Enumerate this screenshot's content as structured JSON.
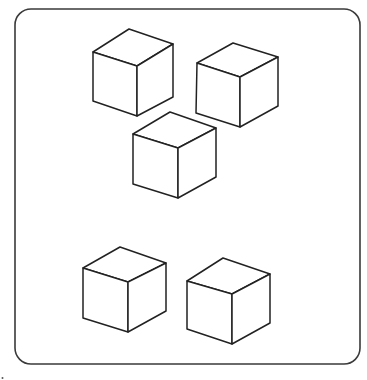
{
  "figure": {
    "frame": {
      "x": 15,
      "y": 9,
      "width": 345,
      "height": 355,
      "radius": 16,
      "stroke": "#3a3a3a"
    },
    "cube_stroke": "#222222",
    "background": "#ffffff",
    "cube_count": 5,
    "cubes": [
      {
        "name": "cube-top-left",
        "top": [
          129,
          29
        ],
        "left_top": [
          93,
          52
        ],
        "right_top": [
          173,
          44
        ],
        "front": [
          137,
          66
        ],
        "left_bottom": [
          93,
          101
        ],
        "front_bottom": [
          137,
          116
        ],
        "right_bottom": [
          173,
          97
        ]
      },
      {
        "name": "cube-top-right",
        "top": [
          233,
          43
        ],
        "left_top": [
          197,
          63
        ],
        "right_top": [
          278,
          57
        ],
        "front": [
          240,
          77
        ],
        "left_bottom": [
          196,
          113
        ],
        "front_bottom": [
          240,
          127
        ],
        "right_bottom": [
          278,
          106
        ]
      },
      {
        "name": "cube-middle",
        "top": [
          170,
          112
        ],
        "left_top": [
          133,
          134
        ],
        "right_top": [
          216,
          128
        ],
        "front": [
          178,
          148
        ],
        "left_bottom": [
          133,
          184
        ],
        "front_bottom": [
          178,
          198
        ],
        "right_bottom": [
          216,
          177
        ]
      },
      {
        "name": "cube-bottom-left",
        "top": [
          120,
          247
        ],
        "left_top": [
          83,
          268
        ],
        "right_top": [
          166,
          263
        ],
        "front": [
          128,
          282
        ],
        "left_bottom": [
          83,
          318
        ],
        "front_bottom": [
          128,
          332
        ],
        "right_bottom": [
          166,
          311
        ]
      },
      {
        "name": "cube-bottom-right",
        "top": [
          223,
          258
        ],
        "left_top": [
          187,
          281
        ],
        "right_top": [
          270,
          274
        ],
        "front": [
          232,
          294
        ],
        "left_bottom": [
          187,
          329
        ],
        "front_bottom": [
          232,
          344
        ],
        "right_bottom": [
          270,
          323
        ]
      }
    ]
  }
}
